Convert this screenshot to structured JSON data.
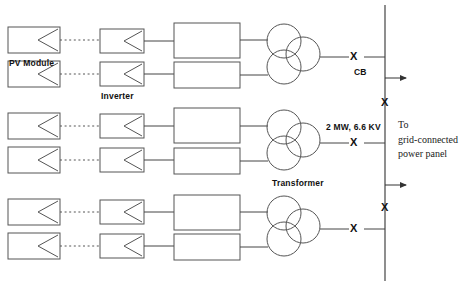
{
  "diagram": {
    "stroke_color": "#555555",
    "text_color": "#111111",
    "background": "#ffffff"
  },
  "labels": {
    "pv_module": "PV Module",
    "inverter": "Inverter",
    "transformer": "Transformer",
    "circuit_breaker": "CB",
    "rating": "2 MW, 6.6 KV",
    "destination_line1": "To",
    "destination_line2": "grid-connected",
    "destination_line3": "power panel"
  },
  "breaker_marks": {
    "feeder_x_symbol": "X",
    "bus_x_symbol": "X",
    "count_feeder": 3,
    "count_bus": 2
  },
  "groups": [
    {
      "name": "group-top",
      "rows": [
        {
          "pv_module": true,
          "inverter": true,
          "block": true
        },
        {
          "pv_module": true,
          "inverter": true,
          "block": true
        }
      ],
      "transformer": true,
      "breaker": "X",
      "breaker_label": "CB"
    },
    {
      "name": "group-middle",
      "rows": [
        {
          "pv_module": true,
          "inverter": true,
          "block": true
        },
        {
          "pv_module": true,
          "inverter": true,
          "block": true
        }
      ],
      "transformer": true,
      "breaker": "X",
      "breaker_label": "2 MW, 6.6 KV"
    },
    {
      "name": "group-bottom",
      "rows": [
        {
          "pv_module": true,
          "inverter": true,
          "block": true
        },
        {
          "pv_module": true,
          "inverter": true,
          "block": true
        }
      ],
      "transformer": true,
      "breaker": "X",
      "breaker_label": ""
    }
  ],
  "bus": {
    "name": "grid-bus",
    "outgoing_arrows": 2
  }
}
